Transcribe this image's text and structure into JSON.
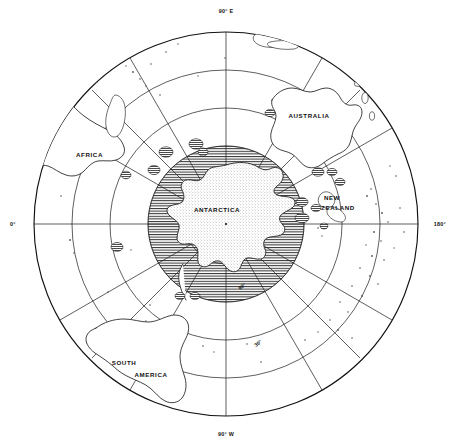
{
  "map": {
    "projection_label": "polar-azimuthal-south",
    "center_pole_label": "south-pole",
    "background_color": "#ffffff",
    "line_color": "#111111",
    "seaice_hatch_color": "#333333",
    "continent_labels": [
      {
        "name": "africa",
        "text": "AFRICA",
        "x": 76,
        "y": 157,
        "rotate": 0
      },
      {
        "name": "australia",
        "text": "AUSTRALIA",
        "x": 309,
        "y": 118,
        "rotate": 0
      },
      {
        "name": "new",
        "text": "NEW",
        "x": 332,
        "y": 200,
        "rotate": 0
      },
      {
        "name": "zealand",
        "text": "ZEALAND",
        "x": 338,
        "y": 210,
        "rotate": 0
      },
      {
        "name": "antarctica",
        "text": "ANTARCTICA",
        "x": 217,
        "y": 212,
        "rotate": 0
      },
      {
        "name": "south",
        "text": "SOUTH",
        "x": 124,
        "y": 365,
        "rotate": 0
      },
      {
        "name": "america",
        "text": "AMERICA",
        "x": 151,
        "y": 377,
        "rotate": 0
      }
    ],
    "meridian_labels": [
      {
        "name": "meridian-90-east",
        "text": "90° E",
        "x": 226,
        "y": 13,
        "anchor": "middle"
      },
      {
        "name": "meridian-90-west",
        "text": "90° W",
        "x": 226,
        "y": 436,
        "anchor": "middle"
      },
      {
        "name": "meridian-0",
        "text": "0°",
        "x": 10,
        "y": 224,
        "anchor": "start"
      },
      {
        "name": "meridian-180",
        "text": "180°",
        "x": 430,
        "y": 224,
        "anchor": "end"
      }
    ],
    "parallel_labels": [
      {
        "name": "parallel-60",
        "text": "60°",
        "x": 240,
        "y": 290,
        "rotate": -38
      },
      {
        "name": "parallel-30",
        "text": "30°",
        "x": 256,
        "y": 347,
        "rotate": -38
      }
    ],
    "parallels_radii": [
      40,
      78,
      116,
      154,
      192
    ],
    "meridian_count": 12,
    "seaice_outer_radius": 78,
    "seaice_description": "horizontal-line-hatched sea ice extent ring around Antarctica",
    "marker_legend": "hatched circles mark sub-Antarctic island groups and stations"
  }
}
